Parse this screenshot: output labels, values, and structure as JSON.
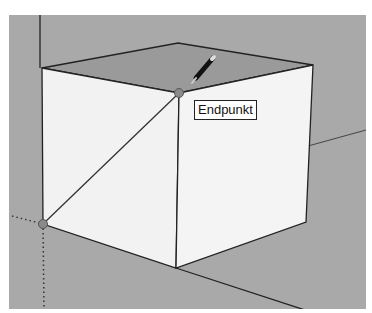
{
  "app": {
    "name": "3D modeling viewport",
    "tool": "pencil-line-tool"
  },
  "viewport": {
    "background_color": "#a9a9a9",
    "face_color": "#f2f2f2",
    "top_face_color": "#9a9a9a",
    "edge_color": "#222222"
  },
  "inference": {
    "tooltip_label": "Endpunkt",
    "snap_points": [
      {
        "name": "endpoint-top-front",
        "x": 179,
        "y": 93
      },
      {
        "name": "endpoint-bottom-left",
        "x": 43,
        "y": 224
      }
    ]
  },
  "cube": {
    "vertices": {
      "top_left": [
        42,
        68
      ],
      "top_back": [
        178,
        43
      ],
      "top_right": [
        313,
        65
      ],
      "top_front": [
        179,
        93
      ],
      "bottom_left": [
        43,
        224
      ],
      "bottom_front": [
        176,
        268
      ],
      "bottom_right": [
        306,
        222
      ]
    }
  }
}
